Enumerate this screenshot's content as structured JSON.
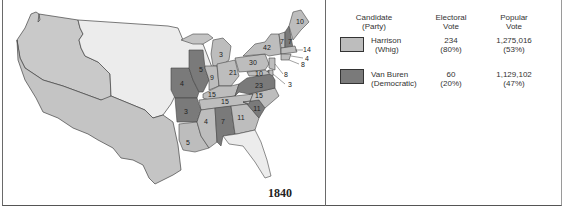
{
  "map": {
    "year": "1840",
    "colors": {
      "whig": "#bdbdbd",
      "democratic": "#7a7a7a",
      "territory": "#e8e8e8",
      "texas": "#c9c9c9",
      "border": "#444444"
    },
    "state_votes": [
      {
        "label": "10",
        "party": "whig"
      },
      {
        "label": "7",
        "party": "whig"
      },
      {
        "label": "7",
        "party": "democratic"
      },
      {
        "label": "14",
        "party": "whig"
      },
      {
        "label": "4",
        "party": "whig"
      },
      {
        "label": "8",
        "party": "whig"
      },
      {
        "label": "42",
        "party": "whig"
      },
      {
        "label": "30",
        "party": "whig"
      },
      {
        "label": "8",
        "party": "whig"
      },
      {
        "label": "3",
        "party": "whig"
      },
      {
        "label": "10",
        "party": "whig"
      },
      {
        "label": "23",
        "party": "democratic"
      },
      {
        "label": "3",
        "party": "whig"
      },
      {
        "label": "21",
        "party": "whig"
      },
      {
        "label": "9",
        "party": "whig"
      },
      {
        "label": "5",
        "party": "democratic"
      },
      {
        "label": "4",
        "party": "democratic"
      },
      {
        "label": "15",
        "party": "whig"
      },
      {
        "label": "15",
        "party": "whig"
      },
      {
        "label": "15",
        "party": "whig"
      },
      {
        "label": "3",
        "party": "democratic"
      },
      {
        "label": "4",
        "party": "whig"
      },
      {
        "label": "7",
        "party": "democratic"
      },
      {
        "label": "11",
        "party": "whig"
      },
      {
        "label": "11",
        "party": "democratic"
      },
      {
        "label": "5",
        "party": "whig"
      }
    ]
  },
  "legend": {
    "headers": {
      "candidate": "Candidate",
      "candidate_sub": "(Party)",
      "electoral": "Electoral",
      "electoral_sub": "Vote",
      "popular": "Popular",
      "popular_sub": "Vote"
    },
    "rows": [
      {
        "name": "Harrison",
        "party": "(Whig)",
        "electoral": "234",
        "electoral_pct": "(80%)",
        "popular": "1,275,016",
        "popular_pct": "(53%)",
        "color": "#bdbdbd"
      },
      {
        "name": "Van Buren",
        "party": "(Democratic)",
        "electoral": "60",
        "electoral_pct": "(20%)",
        "popular": "1,129,102",
        "popular_pct": "(47%)",
        "color": "#7a7a7a"
      }
    ]
  }
}
